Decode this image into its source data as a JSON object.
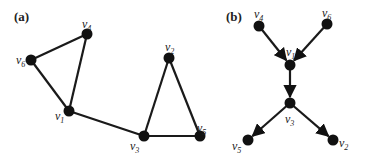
{
  "figure": {
    "panels": [
      {
        "id": "a",
        "label": "(a)",
        "directed": false,
        "nodes": [
          {
            "id": "v4",
            "name": "v",
            "sub": "4"
          },
          {
            "id": "v6",
            "name": "v",
            "sub": "6"
          },
          {
            "id": "v1",
            "name": "v",
            "sub": "1"
          },
          {
            "id": "v3",
            "name": "v",
            "sub": "3"
          },
          {
            "id": "v2",
            "name": "v",
            "sub": "2"
          },
          {
            "id": "v5",
            "name": "v",
            "sub": "5"
          }
        ],
        "edges": [
          [
            "v6",
            "v4"
          ],
          [
            "v4",
            "v1"
          ],
          [
            "v6",
            "v1"
          ],
          [
            "v1",
            "v3"
          ],
          [
            "v3",
            "v2"
          ],
          [
            "v2",
            "v5"
          ],
          [
            "v3",
            "v5"
          ]
        ]
      },
      {
        "id": "b",
        "label": "(b)",
        "directed": true,
        "nodes": [
          {
            "id": "v4",
            "name": "v",
            "sub": "4"
          },
          {
            "id": "v6",
            "name": "v",
            "sub": "6"
          },
          {
            "id": "v1",
            "name": "v",
            "sub": "1"
          },
          {
            "id": "v3",
            "name": "v",
            "sub": "3"
          },
          {
            "id": "v5",
            "name": "v",
            "sub": "5"
          },
          {
            "id": "v2",
            "name": "v",
            "sub": "2"
          }
        ],
        "edges": [
          [
            "v4",
            "v1"
          ],
          [
            "v6",
            "v1"
          ],
          [
            "v1",
            "v3"
          ],
          [
            "v3",
            "v5"
          ],
          [
            "v3",
            "v2"
          ]
        ]
      }
    ]
  }
}
